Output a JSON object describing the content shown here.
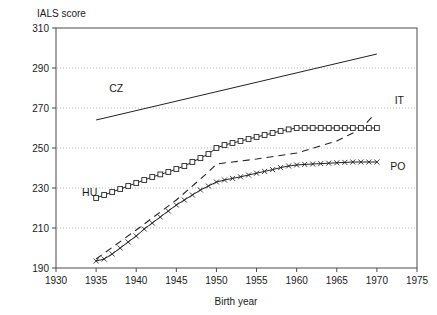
{
  "chart_data": {
    "type": "line",
    "title": "",
    "xlabel": "Birth year",
    "ylabel": "IALS score",
    "xlim": [
      1930,
      1975
    ],
    "ylim": [
      190,
      310
    ],
    "xticks": [
      1930,
      1935,
      1940,
      1945,
      1950,
      1955,
      1960,
      1965,
      1970,
      1975
    ],
    "yticks": [
      190,
      210,
      230,
      250,
      270,
      290,
      310
    ],
    "grid": "horizontal-dotted",
    "legend_position": "inline-annotations",
    "annotations": [
      {
        "text": "CZ",
        "x": 1937.5,
        "y": 278
      },
      {
        "text": "HU",
        "x": 1934.2,
        "y": 226
      },
      {
        "text": "IT",
        "x": 1972.8,
        "y": 272
      },
      {
        "text": "PO",
        "x": 1972.6,
        "y": 239
      }
    ],
    "series": [
      {
        "name": "CZ",
        "style": "solid",
        "marker": "none",
        "x": [
          1935,
          1970
        ],
        "values": [
          264,
          297
        ]
      },
      {
        "name": "HU",
        "style": "solid",
        "marker": "square",
        "x": [
          1935,
          1936,
          1937,
          1938,
          1939,
          1940,
          1941,
          1942,
          1943,
          1944,
          1945,
          1946,
          1947,
          1948,
          1949,
          1950,
          1951,
          1952,
          1953,
          1954,
          1955,
          1956,
          1957,
          1958,
          1959,
          1960,
          1961,
          1962,
          1963,
          1964,
          1965,
          1966,
          1967,
          1968,
          1969,
          1970
        ],
        "values": [
          225,
          226.5,
          228,
          229.5,
          231,
          232.5,
          234,
          235.5,
          236.8,
          238,
          239.5,
          241,
          243,
          245,
          247,
          250,
          251.5,
          252.5,
          253.5,
          254.5,
          255.5,
          256.5,
          257.5,
          258.5,
          259.3,
          260,
          260,
          260,
          260,
          260,
          260,
          260,
          260,
          260,
          260,
          260
        ]
      },
      {
        "name": "PO",
        "style": "solid",
        "marker": "cross",
        "x": [
          1935,
          1936,
          1937,
          1938,
          1939,
          1940,
          1941,
          1942,
          1943,
          1944,
          1945,
          1946,
          1947,
          1948,
          1949,
          1950,
          1951,
          1952,
          1953,
          1954,
          1955,
          1956,
          1957,
          1958,
          1959,
          1960,
          1961,
          1962,
          1963,
          1964,
          1965,
          1966,
          1967,
          1968,
          1969,
          1970
        ],
        "values": [
          193.5,
          194.5,
          197,
          200,
          203,
          206,
          209.5,
          212.5,
          215.5,
          218.5,
          221.5,
          224,
          226.5,
          229,
          231,
          233,
          234,
          234.8,
          235.6,
          236.5,
          237.4,
          238.3,
          239.2,
          240.2,
          241,
          241.5,
          241.8,
          242,
          242.2,
          242.4,
          242.6,
          242.8,
          243,
          243,
          243,
          243
        ]
      },
      {
        "name": "IT",
        "style": "dashed",
        "marker": "none",
        "x": [
          1935,
          1940,
          1945,
          1949,
          1950,
          1952,
          1955,
          1960,
          1965,
          1968,
          1969.5
        ],
        "values": [
          194.5,
          209,
          224,
          238,
          242,
          243,
          244.5,
          247.5,
          253.5,
          259.5,
          266
        ]
      }
    ]
  }
}
